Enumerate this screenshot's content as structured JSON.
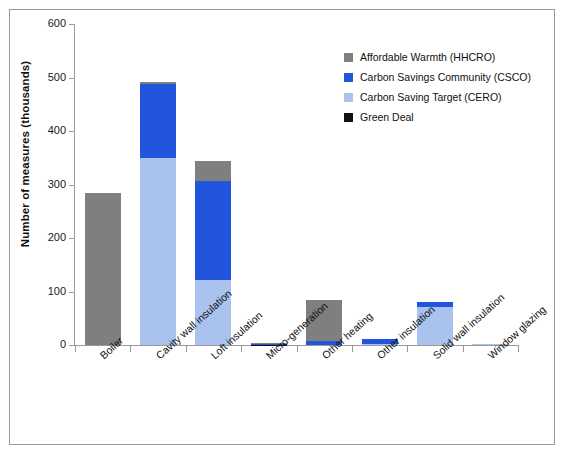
{
  "chart_data": {
    "type": "bar",
    "subtype": "stacked",
    "title": "",
    "xlabel": "",
    "ylabel": "Number of measures (thousands)",
    "ylim": [
      0,
      600
    ],
    "yticks": [
      0,
      100,
      200,
      300,
      400,
      500,
      600
    ],
    "ytick_labels": [
      "0",
      "100",
      "200",
      "300",
      "400",
      "500",
      "600"
    ],
    "grid": false,
    "legend_position": "upper right",
    "categories": [
      "Boiler",
      "Cavity wall insulation",
      "Loft insulation",
      "Micro-generation",
      "Other heating",
      "Other insulation",
      "Solid wall insulation",
      "Window glazing"
    ],
    "series": [
      {
        "name": "Green Deal",
        "color": "#111111",
        "values": [
          0,
          0,
          0,
          0.5,
          0,
          0,
          0,
          0
        ]
      },
      {
        "name": "Carbon Saving Target (CERO)",
        "color": "#a9c2ee",
        "values": [
          0,
          350,
          122,
          0,
          0,
          1,
          71,
          1
        ]
      },
      {
        "name": "Carbon Savings Community (CSCO)",
        "color": "#2255dd",
        "values": [
          0,
          137,
          185,
          0.5,
          8,
          10,
          10,
          0.4
        ]
      },
      {
        "name": "Affordable Warmth (HHCRO)",
        "color": "#7f7f7f",
        "values": [
          284,
          5,
          37,
          2,
          77,
          1,
          0,
          0.6
        ]
      }
    ],
    "totals": [
      284,
      492,
      344,
      3,
      85,
      12,
      81,
      2
    ],
    "legend": [
      {
        "label": "Affordable Warmth (HHCRO)",
        "color": "#7f7f7f"
      },
      {
        "label": "Carbon Savings Community (CSCO)",
        "color": "#2255dd"
      },
      {
        "label": "Carbon Saving Target (CERO)",
        "color": "#a9c2ee"
      },
      {
        "label": "Green Deal",
        "color": "#111111"
      }
    ]
  }
}
